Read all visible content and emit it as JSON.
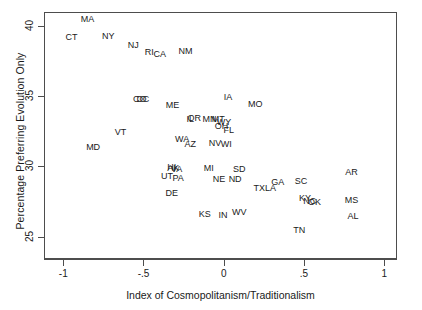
{
  "chart_data": {
    "type": "scatter",
    "title": "",
    "xlabel": "Index of Cosmopolitanism/Traditionalism",
    "ylabel": "Percentage Preferring Evolution Only",
    "xlim": [
      -1.12,
      1.08
    ],
    "ylim": [
      23.4,
      41.0
    ],
    "xticks": [
      -1,
      -0.5,
      0,
      0.5,
      1
    ],
    "xticklabels": [
      "-1",
      "-.5",
      "0",
      ".5",
      "1"
    ],
    "yticks": [
      25,
      30,
      35,
      40
    ],
    "yticklabels": [
      "25",
      "30",
      "35",
      "40"
    ],
    "grid": false,
    "legend": null,
    "marker_style": "text-label",
    "points": [
      {
        "label": "MA",
        "x": -0.855,
        "y": 40.55
      },
      {
        "label": "CT",
        "x": -0.955,
        "y": 39.3
      },
      {
        "label": "NY",
        "x": -0.725,
        "y": 39.35
      },
      {
        "label": "NJ",
        "x": -0.57,
        "y": 38.75
      },
      {
        "label": "RI",
        "x": -0.47,
        "y": 38.2
      },
      {
        "label": "CA",
        "x": -0.405,
        "y": 38.05
      },
      {
        "label": "NM",
        "x": -0.245,
        "y": 38.3
      },
      {
        "label": "CO",
        "x": -0.53,
        "y": 34.85
      },
      {
        "label": "DC",
        "x": -0.51,
        "y": 34.85
      },
      {
        "label": "ME",
        "x": -0.325,
        "y": 34.45
      },
      {
        "label": "IA",
        "x": 0.02,
        "y": 35.0
      },
      {
        "label": "MO",
        "x": 0.19,
        "y": 34.55
      },
      {
        "label": "IL",
        "x": -0.215,
        "y": 33.45
      },
      {
        "label": "OR",
        "x": -0.19,
        "y": 33.55
      },
      {
        "label": "MN",
        "x": -0.095,
        "y": 33.45
      },
      {
        "label": "MT",
        "x": -0.04,
        "y": 33.45
      },
      {
        "label": "WY",
        "x": -0.005,
        "y": 33.25
      },
      {
        "label": "OH",
        "x": -0.02,
        "y": 32.95
      },
      {
        "label": "FL",
        "x": 0.025,
        "y": 32.65
      },
      {
        "label": "VT",
        "x": -0.65,
        "y": 32.55
      },
      {
        "label": "WA",
        "x": -0.265,
        "y": 32.05
      },
      {
        "label": "AZ",
        "x": -0.215,
        "y": 31.7
      },
      {
        "label": "NV",
        "x": -0.06,
        "y": 31.75
      },
      {
        "label": "WI",
        "x": 0.01,
        "y": 31.7
      },
      {
        "label": "MD",
        "x": -0.82,
        "y": 31.45
      },
      {
        "label": "HI",
        "x": -0.33,
        "y": 30.0
      },
      {
        "label": "AK",
        "x": -0.32,
        "y": 29.95
      },
      {
        "label": "VA",
        "x": -0.3,
        "y": 29.85
      },
      {
        "label": "MI",
        "x": -0.1,
        "y": 29.95
      },
      {
        "label": "SD",
        "x": 0.09,
        "y": 29.9
      },
      {
        "label": "UT",
        "x": -0.36,
        "y": 29.35
      },
      {
        "label": "PA",
        "x": -0.29,
        "y": 29.25
      },
      {
        "label": "NE",
        "x": -0.035,
        "y": 29.2
      },
      {
        "label": "ND",
        "x": 0.065,
        "y": 29.15
      },
      {
        "label": "GA",
        "x": 0.33,
        "y": 28.95
      },
      {
        "label": "SC",
        "x": 0.475,
        "y": 29.05
      },
      {
        "label": "AR",
        "x": 0.79,
        "y": 29.65
      },
      {
        "label": "TX",
        "x": 0.215,
        "y": 28.55
      },
      {
        "label": "LA",
        "x": 0.285,
        "y": 28.55
      },
      {
        "label": "DE",
        "x": -0.33,
        "y": 28.15
      },
      {
        "label": "KY",
        "x": 0.5,
        "y": 27.8
      },
      {
        "label": "NC",
        "x": 0.53,
        "y": 27.6
      },
      {
        "label": "OK",
        "x": 0.56,
        "y": 27.55
      },
      {
        "label": "MS",
        "x": 0.79,
        "y": 27.7
      },
      {
        "label": "KS",
        "x": -0.125,
        "y": 26.65
      },
      {
        "label": "IN",
        "x": -0.01,
        "y": 26.6
      },
      {
        "label": "WV",
        "x": 0.09,
        "y": 26.8
      },
      {
        "label": "AL",
        "x": 0.8,
        "y": 26.55
      },
      {
        "label": "TN",
        "x": 0.465,
        "y": 25.55
      }
    ]
  }
}
